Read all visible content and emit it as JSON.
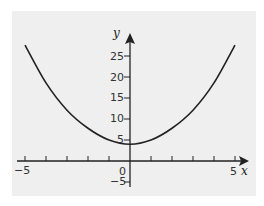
{
  "chart_data": {
    "type": "line",
    "title": "",
    "xlabel": "x",
    "ylabel": "y",
    "xlim": [
      -5.3,
      5.5
    ],
    "ylim": [
      -6,
      31
    ],
    "grid": false,
    "legend": null,
    "x_ticks": [
      -5,
      -4,
      -3,
      -2,
      -1,
      0,
      1,
      2,
      3,
      4,
      5
    ],
    "x_tick_labels": [
      {
        "value": -5,
        "label": "-5"
      },
      {
        "value": 0,
        "label": "0"
      },
      {
        "value": 5,
        "label": "5"
      }
    ],
    "y_ticks": [
      -5,
      5,
      10,
      15,
      20,
      25
    ],
    "y_tick_labels": [
      "-5",
      "5",
      "10",
      "15",
      "20",
      "25"
    ],
    "series": [
      {
        "name": "curve",
        "color": "#222222",
        "x": [
          -5,
          -4,
          -3,
          -2,
          -1,
          0,
          1,
          2,
          3,
          4,
          5
        ],
        "values": [
          27.6,
          18.6,
          12.1,
          7.8,
          5.0,
          4.0,
          5.0,
          7.8,
          12.1,
          18.6,
          27.6
        ]
      }
    ]
  },
  "labels": {
    "x_axis": "x",
    "y_axis": "y",
    "origin": "0",
    "x_min": "−5",
    "x_max": "5",
    "y_ticks": [
      "25",
      "20",
      "15",
      "10",
      "5",
      "−5"
    ]
  },
  "colors": {
    "background": "#efefef",
    "ink": "#222222"
  }
}
